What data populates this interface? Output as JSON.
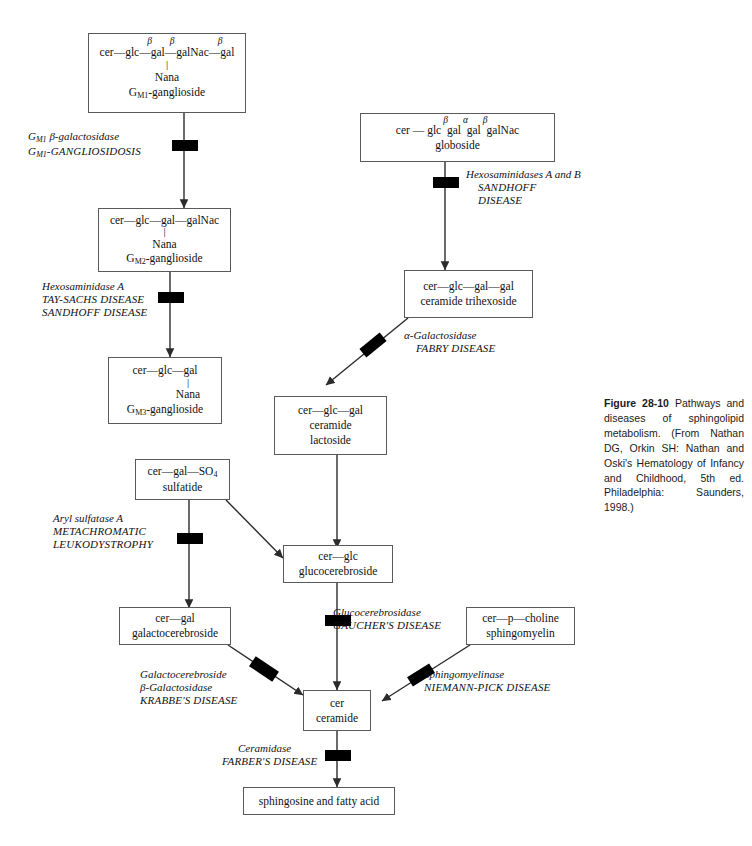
{
  "figure": {
    "label": "Figure 28-10",
    "caption": " Pathways and diseases of sphingolipid metabolism. (From Nathan DG, Orkin SH: Nathan and Oski's Hematology of Infancy and Childhood, 5th ed. Philadelphia: Saunders, 1998.)"
  },
  "nodes": {
    "gm1": {
      "name": "gm1-ganglioside",
      "line1_a": "cer",
      "line1_b": "glc",
      "line1_c": "gal",
      "line1_d": "galNac",
      "line1_e": "gal",
      "bond1": "β",
      "bond2": "β",
      "bond3": "β",
      "branch": "Nana",
      "label_main": "G",
      "label_sub": "M1",
      "label_tail": "-ganglioside"
    },
    "globoside": {
      "name": "globoside",
      "seq": "cer — glc",
      "b1": "β",
      "s2": "gal",
      "b2": "α",
      "s3": "gal",
      "b3": "β",
      "s4": "galNac",
      "label": "globoside"
    },
    "gm2": {
      "name": "gm2-ganglioside",
      "chain": "cer—glc—gal—galNac",
      "branch": "Nana",
      "label_main": "G",
      "label_sub": "M2",
      "label_tail": "-ganglioside"
    },
    "trihexoside": {
      "name": "ceramide-trihexoside",
      "chain": "cer—glc—gal—gal",
      "label": "ceramide trihexoside"
    },
    "gm3": {
      "name": "gm3-ganglioside",
      "chain": "cer—glc—gal",
      "branch": "Nana",
      "label_main": "G",
      "label_sub": "M3",
      "label_tail": "-ganglioside"
    },
    "lactoside": {
      "name": "ceramide-lactoside",
      "chain": "cer—glc—gal",
      "label1": "ceramide",
      "label2": "lactoside"
    },
    "sulfatide": {
      "name": "sulfatide",
      "chain": "cer—gal—SO",
      "chain_sub": "4",
      "label": "sulfatide"
    },
    "glucocerebroside": {
      "name": "glucocerebroside",
      "chain": "cer—glc",
      "label": "glucocerebroside"
    },
    "galactocerebroside": {
      "name": "galactocerebroside",
      "chain": "cer—gal",
      "label": "galactocerebroside"
    },
    "sphingomyelin": {
      "name": "sphingomyelin",
      "chain": "cer—p—choline",
      "label": "sphingomyelin"
    },
    "ceramide": {
      "name": "ceramide",
      "chain": "cer",
      "label": "ceramide"
    },
    "products": {
      "name": "sphingosine-and-fatty-acid",
      "label": "sphingosine and fatty acid"
    }
  },
  "steps": {
    "gm1_gal": {
      "enzyme_main": "G",
      "enzyme_sub": "M1",
      "enzyme_rest": " β-galactosidase",
      "disease_main": "G",
      "disease_sub": "M1",
      "disease_rest": "-GANGLIOSIDOSIS"
    },
    "hexa": {
      "enzyme": "Hexosaminidase A",
      "disease1": "TAY-SACHS DISEASE",
      "disease2": "SANDHOFF DISEASE"
    },
    "hexab": {
      "enzyme": "Hexosaminidases A and B",
      "disease1": "SANDHOFF",
      "disease2": "DISEASE"
    },
    "fabry": {
      "enzyme": "α-Galactosidase",
      "disease": "FABRY DISEASE"
    },
    "mld": {
      "enzyme": "Aryl sulfatase A",
      "disease1": "METACHROMATIC",
      "disease2": "LEUKODYSTROPHY"
    },
    "gaucher": {
      "enzyme": "Glucocerebrosidase",
      "disease": "GAUCHER'S DISEASE"
    },
    "krabbe": {
      "enzyme1": "Galactocerebroside",
      "enzyme2": "β-Galactosidase",
      "disease": "KRABBE'S DISEASE"
    },
    "niemannpick": {
      "enzyme": "Sphingomyelinase",
      "disease": "NIEMANN-PICK DISEASE"
    },
    "farber": {
      "enzyme": "Ceramidase",
      "disease": "FARBER'S DISEASE"
    }
  },
  "colors": {
    "stroke": "#2b2b2b",
    "box_border": "#5a5a5a",
    "block_bar": "#000000",
    "text": "#111111",
    "background": "#ffffff"
  }
}
